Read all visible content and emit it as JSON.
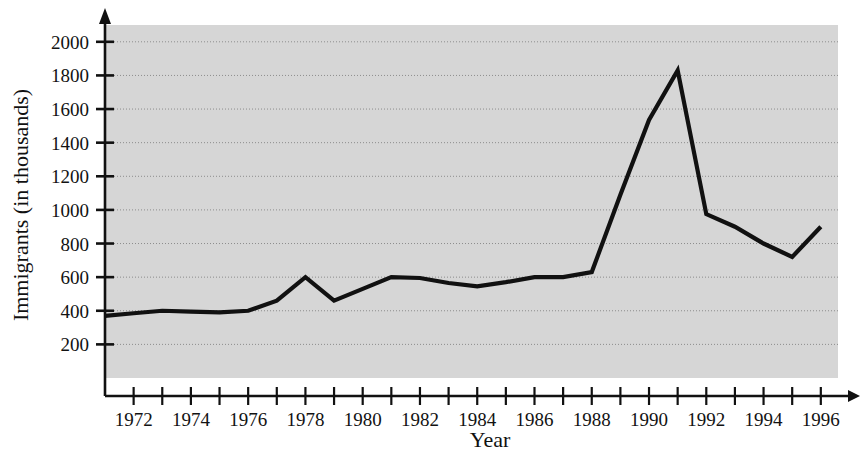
{
  "chart_data": {
    "type": "line",
    "title": "",
    "xlabel": "Year",
    "ylabel": "Immigrants (in thousands)",
    "xlim": [
      1971,
      1996.6
    ],
    "ylim": [
      0,
      2100
    ],
    "grid": true,
    "legend": "none",
    "plot_background": "#d6d6d6",
    "line_color": "#111111",
    "gridline_color": "#8d8d8d",
    "axis_color": "#111111",
    "y_ticks": [
      200,
      400,
      600,
      800,
      1000,
      1200,
      1400,
      1600,
      1800,
      2000
    ],
    "y_tick_labels": [
      "200",
      "400",
      "600",
      "800",
      "1000",
      "1200",
      "1400",
      "1600",
      "1800",
      "2000"
    ],
    "x_ticks": [
      1972,
      1973,
      1974,
      1975,
      1976,
      1977,
      1978,
      1979,
      1980,
      1981,
      1982,
      1983,
      1984,
      1985,
      1986,
      1987,
      1988,
      1989,
      1990,
      1991,
      1992,
      1993,
      1994,
      1995,
      1996
    ],
    "x_tick_labels_shown": [
      "1972",
      "1974",
      "1976",
      "1978",
      "1980",
      "1982",
      "1984",
      "1986",
      "1988",
      "1990",
      "1992",
      "1994",
      "1996"
    ],
    "x": [
      1971,
      1972,
      1973,
      1974,
      1975,
      1976,
      1977,
      1978,
      1979,
      1980,
      1981,
      1982,
      1983,
      1984,
      1985,
      1986,
      1987,
      1988,
      1989,
      1990,
      1991,
      1992,
      1993,
      1994,
      1995,
      1996
    ],
    "values": [
      370,
      385,
      400,
      395,
      390,
      400,
      460,
      600,
      460,
      530,
      600,
      595,
      565,
      545,
      570,
      600,
      600,
      630,
      1090,
      1535,
      1830,
      975,
      900,
      800,
      720,
      900
    ],
    "series": [
      {
        "name": "Immigrants",
        "values": [
          370,
          385,
          400,
          395,
          390,
          400,
          460,
          600,
          460,
          530,
          600,
          595,
          565,
          545,
          570,
          600,
          600,
          630,
          1090,
          1535,
          1830,
          975,
          900,
          800,
          720,
          900
        ]
      }
    ],
    "annotations": []
  }
}
